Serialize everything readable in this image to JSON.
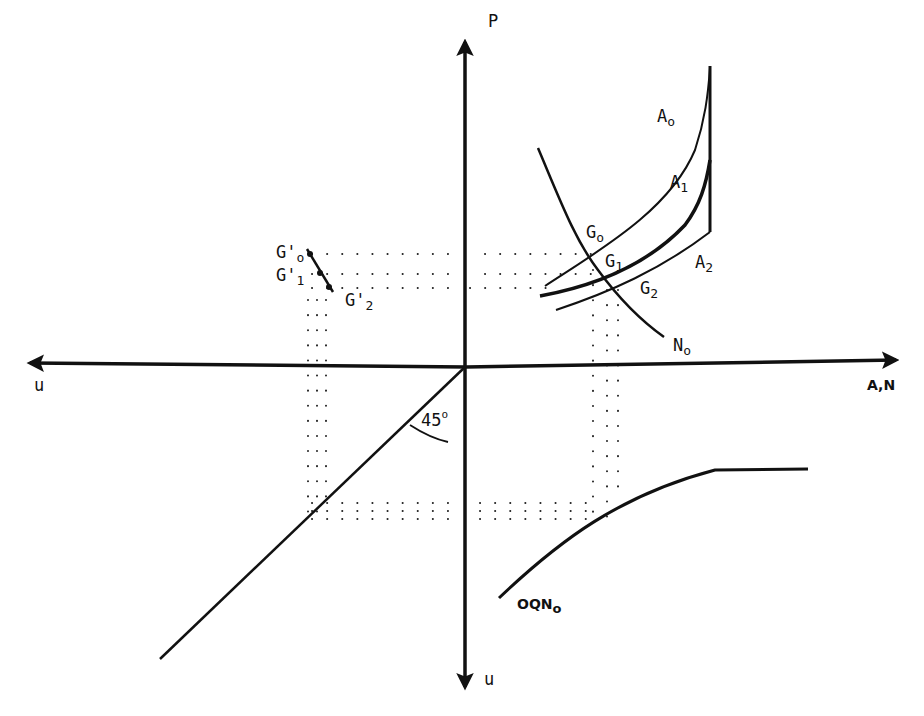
{
  "diagram": {
    "axes": {
      "up_label": "P",
      "right_label": "A,N",
      "left_label": "u",
      "down_label": "u"
    },
    "curves": {
      "a0": "A",
      "a0_sub": "o",
      "a1": "A",
      "a1_sub": "1",
      "a2": "A",
      "a2_sub": "2",
      "n0": "N",
      "n0_sub": "o",
      "oqn": "OQN",
      "oqn_sub": "o"
    },
    "points": {
      "g0": "G",
      "g0_sub": "o",
      "g1": "G",
      "g1_sub": "1",
      "g2": "G",
      "g2_sub": "2",
      "g0p": "G'",
      "g0p_sub": "o",
      "g1p": "G'",
      "g1p_sub": "1",
      "g2p": "G'",
      "g2p_sub": "2"
    },
    "angle": {
      "value": "45",
      "unit": "o"
    },
    "colors": {
      "ink": "#111111",
      "background": "#ffffff"
    }
  }
}
